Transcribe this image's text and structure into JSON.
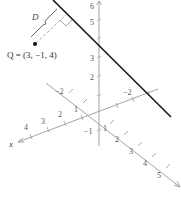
{
  "figure": {
    "point_label": "Q = (3, −1, 4)",
    "distance_label": "D",
    "axes": {
      "x": {
        "label": "x",
        "ticks": [
          "4",
          "3",
          "2",
          "1"
        ],
        "neg_tick": "−2"
      },
      "y": {
        "ticks": [
          "1",
          "2",
          "3",
          "4",
          "5"
        ],
        "neg_tick": "−2"
      },
      "z": {
        "ticks": [
          "6",
          "5",
          "3",
          "2"
        ],
        "neg_tick": "−1"
      }
    },
    "colors": {
      "line": "#1a1a1a",
      "axes": "#9a9a9a",
      "text": "#444444"
    }
  }
}
